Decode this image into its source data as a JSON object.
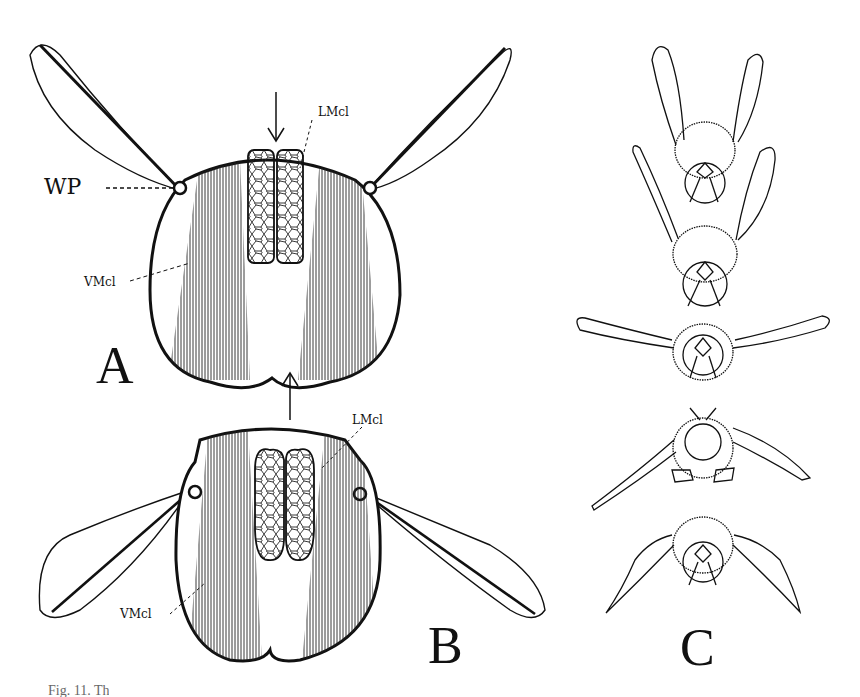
{
  "figure": {
    "panels": [
      {
        "id": "A",
        "label": "A",
        "description": "Cross-section of thorax with wings raised; arrow pointing down onto dorsal surface",
        "annotations": {
          "wing_process": "WP",
          "longitudinal_muscles": "LMcl",
          "vertical_muscles": "VMcl"
        },
        "arrow": "down"
      },
      {
        "id": "B",
        "label": "B",
        "description": "Cross-section of thorax with wings lowered; arrow pointing up from dorsal surface",
        "annotations": {
          "longitudinal_muscles": "LMcl",
          "vertical_muscles": "VMcl"
        },
        "arrow": "up"
      },
      {
        "id": "C",
        "label": "C",
        "description": "Sequence of five front views of a bee showing wing positions during a stroke"
      }
    ],
    "caption_partial": "Fig. 11. Th"
  }
}
